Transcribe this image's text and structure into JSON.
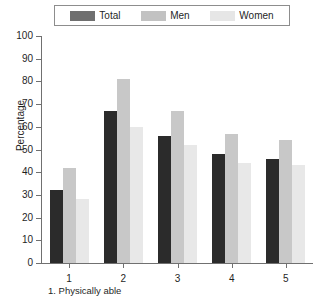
{
  "legend": {
    "entries": [
      {
        "label": "Total",
        "color": "#6f6f6f"
      },
      {
        "label": "Men",
        "color": "#c2c2c2"
      },
      {
        "label": "Women",
        "color": "#e6e6e6"
      }
    ]
  },
  "axes": {
    "ylabel": "Percentage",
    "yticks": [
      "0",
      "10",
      "20",
      "30",
      "40",
      "50",
      "60",
      "70",
      "80",
      "90",
      "100"
    ],
    "xticks": [
      "1",
      "2",
      "3",
      "4",
      "5"
    ]
  },
  "caption": {
    "line1": "1. Physically able",
    "line2": ""
  },
  "series_colors": {
    "total": "#2b2b2b",
    "men": "#c8c8c8",
    "women": "#e8e8e8"
  },
  "chart_data": {
    "type": "bar",
    "title": "",
    "xlabel": "",
    "ylabel": "Percentage",
    "ylim": [
      0,
      100
    ],
    "ytick_step": 10,
    "grid": false,
    "legend_position": "top",
    "categories": [
      "1",
      "2",
      "3",
      "4",
      "5"
    ],
    "series": [
      {
        "name": "Total",
        "values": [
          32,
          67,
          56,
          48,
          46
        ]
      },
      {
        "name": "Men",
        "values": [
          42,
          81,
          67,
          57,
          54
        ]
      },
      {
        "name": "Women",
        "values": [
          28,
          60,
          52,
          44,
          43
        ]
      }
    ]
  }
}
